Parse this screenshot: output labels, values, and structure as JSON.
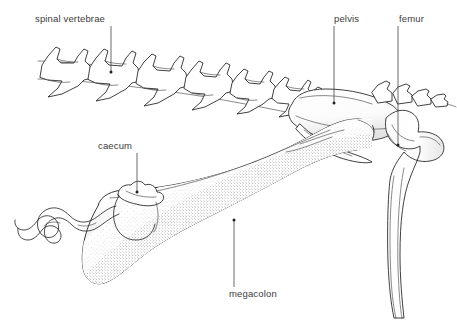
{
  "figure": {
    "background_color": "#ffffff",
    "line_color": "#2b2b2b",
    "label_color": "#3c3c3c",
    "leader_color": "#444444",
    "width": 457,
    "height": 323
  },
  "labels": {
    "spinal_vertebrae": "spinal vertebrae",
    "pelvis": "pelvis",
    "femur": "femur",
    "caecum": "caecum",
    "megacolon": "megacolon"
  },
  "structures": [
    {
      "name": "spinal-vertebrae",
      "label": "spinal vertebrae",
      "region": "upper-left",
      "description": "row of lumbar vertebrae in receding perspective"
    },
    {
      "name": "pelvis",
      "label": "pelvis",
      "region": "upper-right",
      "description": "ilium and pelvic girdle"
    },
    {
      "name": "femur",
      "label": "femur",
      "region": "right",
      "description": "femoral head and shaft descending"
    },
    {
      "name": "caecum",
      "label": "caecum",
      "region": "mid-left",
      "description": "small pouch with coiled ileum"
    },
    {
      "name": "megacolon",
      "label": "megacolon",
      "region": "lower-centre",
      "description": "grossly distended colon with stippled shading"
    }
  ],
  "leaders": [
    {
      "name": "leader-spinal-vertebrae",
      "from_x": 111,
      "from_y": 26,
      "to_x": 111,
      "to_y": 72
    },
    {
      "name": "leader-pelvis",
      "from_x": 334,
      "from_y": 26,
      "to_x": 334,
      "to_y": 103
    },
    {
      "name": "leader-femur",
      "from_x": 398,
      "from_y": 26,
      "to_x": 398,
      "to_y": 145
    },
    {
      "name": "leader-caecum",
      "from_x": 137,
      "from_y": 153,
      "to_x": 137,
      "to_y": 192
    },
    {
      "name": "leader-megacolon",
      "from_x": 234,
      "from_y": 287,
      "to_x": 234,
      "to_y": 220
    }
  ]
}
